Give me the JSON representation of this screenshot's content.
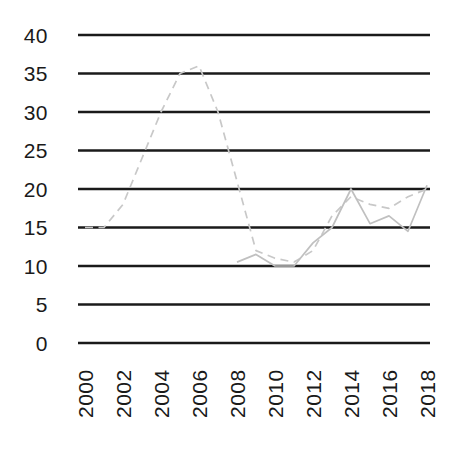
{
  "figure": {
    "width_px": 453,
    "height_px": 450,
    "background": "#ffffff",
    "title": "",
    "legend": "none"
  },
  "chart_data": {
    "type": "line",
    "title": "",
    "xlabel": "",
    "ylabel": "",
    "x_range": [
      2000,
      2018
    ],
    "ylim": [
      0,
      40
    ],
    "x_tick_labels": [
      "2000",
      "2002",
      "2004",
      "2006",
      "2008",
      "2010",
      "2012",
      "2014",
      "2016",
      "2018"
    ],
    "y_tick_labels": [
      "0",
      "5",
      "10",
      "15",
      "20",
      "25",
      "30",
      "35",
      "40"
    ],
    "y_ticks": [
      0,
      5,
      10,
      15,
      20,
      25,
      30,
      35,
      40
    ],
    "grid": {
      "horizontal": true,
      "vertical": false,
      "color": "#1a1a1a"
    },
    "tick_label_color": "#1a1a1a",
    "x_tick_label_rotation_deg": -90,
    "series": [
      {
        "name": "dashed-series",
        "line_style": "dashed",
        "color": "#c8c8c8",
        "x": [
          2000,
          2001,
          2002,
          2003,
          2004,
          2005,
          2006,
          2007,
          2008,
          2009,
          2010,
          2011,
          2012,
          2013,
          2014,
          2015,
          2016,
          2017,
          2018
        ],
        "values": [
          15,
          15,
          18,
          24,
          30,
          35,
          36,
          30,
          21,
          12,
          11,
          10.5,
          12,
          16.5,
          19,
          18,
          17.5,
          19,
          20
        ]
      },
      {
        "name": "solid-series",
        "line_style": "solid",
        "color": "#c0c0c0",
        "x": [
          2008,
          2009,
          2010,
          2011,
          2012,
          2013,
          2014,
          2015,
          2016,
          2017,
          2018
        ],
        "values": [
          10.5,
          11.5,
          10,
          10,
          13,
          15,
          20,
          15.5,
          16.5,
          14.5,
          20.5
        ]
      }
    ]
  }
}
